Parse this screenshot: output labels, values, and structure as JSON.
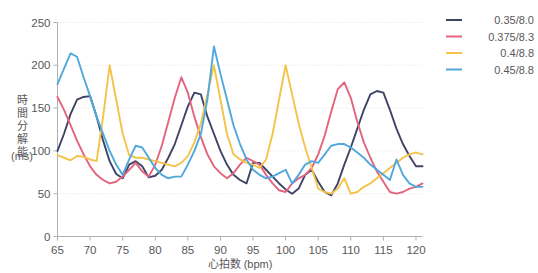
{
  "chart_data": {
    "type": "line",
    "title": "",
    "xlabel": "心拍数 (bpm)",
    "ylabel": "時間分解能 (ms)",
    "ylabel_line1": "時間分解能",
    "ylabel_line2": "(ms)",
    "xlim": [
      65,
      121
    ],
    "ylim": [
      0,
      250
    ],
    "xticks": [
      65,
      70,
      75,
      80,
      85,
      90,
      95,
      100,
      105,
      110,
      115,
      120
    ],
    "yticks": [
      0,
      50,
      100,
      150,
      200,
      250
    ],
    "grid": true,
    "legend_position": "right",
    "x": [
      65,
      66,
      67,
      68,
      69,
      70,
      71,
      72,
      73,
      74,
      75,
      76,
      77,
      78,
      79,
      80,
      81,
      82,
      83,
      84,
      85,
      86,
      87,
      88,
      89,
      90,
      91,
      92,
      93,
      94,
      95,
      96,
      97,
      98,
      99,
      100,
      101,
      102,
      103,
      104,
      105,
      106,
      107,
      108,
      109,
      110,
      111,
      112,
      113,
      114,
      115,
      116,
      117,
      118,
      119,
      120,
      121
    ],
    "series": [
      {
        "name": "0.35/8.0",
        "color": "#3f4466",
        "values": [
          100,
          120,
          143,
          160,
          163,
          164,
          140,
          112,
          88,
          73,
          68,
          84,
          88,
          82,
          69,
          71,
          78,
          92,
          108,
          130,
          152,
          168,
          166,
          140,
          120,
          100,
          84,
          72,
          66,
          62,
          86,
          86,
          78,
          70,
          62,
          55,
          50,
          56,
          72,
          78,
          64,
          52,
          48,
          62,
          84,
          104,
          126,
          148,
          166,
          170,
          168,
          148,
          126,
          108,
          94,
          82,
          82
        ]
      },
      {
        "name": "0.375/8.3",
        "color": "#e4647e",
        "values": [
          163,
          148,
          130,
          112,
          96,
          82,
          72,
          66,
          62,
          64,
          70,
          78,
          86,
          76,
          70,
          84,
          106,
          134,
          162,
          186,
          168,
          140,
          116,
          96,
          82,
          74,
          68,
          74,
          84,
          92,
          88,
          84,
          72,
          62,
          54,
          52,
          62,
          68,
          72,
          80,
          96,
          118,
          146,
          172,
          180,
          162,
          134,
          110,
          92,
          76,
          64,
          52,
          50,
          52,
          56,
          58,
          62
        ]
      },
      {
        "name": "0.4/8.8",
        "color": "#f3c34a",
        "values": [
          95,
          92,
          89,
          94,
          93,
          90,
          88,
          140,
          200,
          160,
          120,
          95,
          92,
          92,
          90,
          88,
          86,
          84,
          82,
          86,
          94,
          110,
          132,
          166,
          200,
          160,
          120,
          96,
          90,
          86,
          84,
          80,
          90,
          120,
          160,
          200,
          166,
          132,
          104,
          80,
          56,
          52,
          50,
          56,
          68,
          50,
          52,
          58,
          62,
          68,
          74,
          80,
          86,
          92,
          96,
          98,
          96
        ]
      },
      {
        "name": "0.45/8.8",
        "color": "#50a8dd",
        "values": [
          178,
          196,
          214,
          210,
          186,
          164,
          140,
          120,
          100,
          84,
          72,
          90,
          106,
          104,
          92,
          80,
          72,
          68,
          70,
          70,
          84,
          100,
          120,
          160,
          222,
          190,
          160,
          130,
          108,
          90,
          78,
          72,
          68,
          70,
          74,
          78,
          62,
          72,
          84,
          88,
          86,
          96,
          106,
          108,
          108,
          104,
          98,
          92,
          84,
          78,
          72,
          66,
          90,
          72,
          62,
          58,
          58
        ]
      }
    ]
  }
}
